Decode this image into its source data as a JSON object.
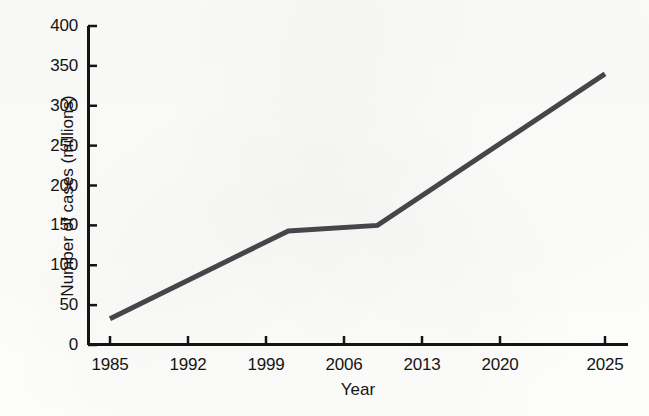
{
  "chart_data": {
    "type": "line",
    "title": "",
    "xlabel": "Year",
    "ylabel": "Number of cases (millions)",
    "xlim": [
      1985,
      2025
    ],
    "ylim": [
      0,
      400
    ],
    "grid": false,
    "legend": null,
    "xticks": [
      "1985",
      "1992",
      "1999",
      "2006",
      "2013",
      "2020",
      "2025"
    ],
    "xtick_values": [
      1985,
      1992,
      1999,
      2006,
      2013,
      2020,
      2025
    ],
    "yticks": [
      "0",
      "50",
      "100",
      "150",
      "200",
      "250",
      "300",
      "350",
      "400"
    ],
    "ytick_values": [
      0,
      50,
      100,
      150,
      200,
      250,
      300,
      350,
      400
    ],
    "series": [
      {
        "name": "Number of cases",
        "color": "#45454a",
        "line_width": 5,
        "x": [
          1985,
          2001,
          2009,
          2025
        ],
        "values": [
          33,
          143,
          150,
          340
        ],
        "points": [
          {
            "x": 1985,
            "y": 33
          },
          {
            "x": 2001,
            "y": 143
          },
          {
            "x": 2009,
            "y": 150
          },
          {
            "x": 2025,
            "y": 340
          }
        ]
      }
    ]
  },
  "figure": {
    "background_color": "#fdfdfc",
    "axis_color": "#141414",
    "text_color": "#141414"
  }
}
